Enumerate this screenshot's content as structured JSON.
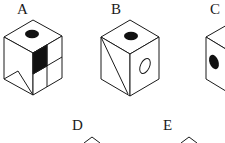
{
  "figure": {
    "options": [
      {
        "id": "A",
        "label": "A"
      },
      {
        "id": "B",
        "label": "B"
      },
      {
        "id": "C",
        "label": "C"
      },
      {
        "id": "D",
        "label": "D"
      },
      {
        "id": "E",
        "label": "E"
      }
    ],
    "colors": {
      "stroke": "#1a1a1a",
      "fill_dark": "#111111",
      "background": "#ffffff"
    }
  }
}
